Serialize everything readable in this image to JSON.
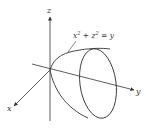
{
  "figure": {
    "axes": {
      "x": {
        "label": "x"
      },
      "y": {
        "label": "y"
      },
      "z": {
        "label": "z"
      }
    },
    "surface": {
      "equation_lhs_x": "x",
      "equation_exp1": "2",
      "equation_plus": " + z",
      "equation_exp2": "2",
      "equation_rhs": " = y"
    },
    "colors": {
      "stroke": "#333333",
      "background": "#ffffff"
    }
  }
}
